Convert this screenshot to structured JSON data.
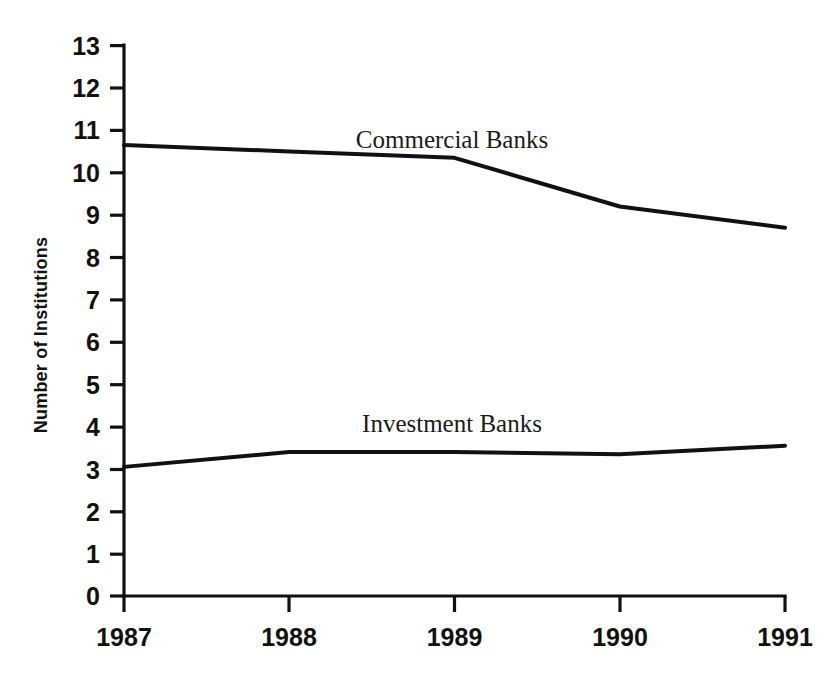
{
  "chart_data": {
    "type": "line",
    "title": "",
    "subtitle": "",
    "xlabel": "",
    "ylabel": "Number of Institutions",
    "x": [
      "1987",
      "1988",
      "1989",
      "1990",
      "1991"
    ],
    "categories": [
      "1987",
      "1988",
      "1989",
      "1990",
      "1991"
    ],
    "series": [
      {
        "name": "Commercial Banks",
        "values": [
          10.65,
          10.5,
          10.35,
          9.2,
          8.7
        ]
      },
      {
        "name": "Investment Banks",
        "values": [
          3.05,
          3.4,
          3.4,
          3.35,
          3.55
        ]
      }
    ],
    "xlim": [
      1987,
      1991
    ],
    "ylim": [
      0,
      13
    ],
    "ytick_labels": [
      "0",
      "1",
      "2",
      "3",
      "4",
      "5",
      "6",
      "7",
      "8",
      "9",
      "10",
      "11",
      "12",
      "13"
    ],
    "ytick_values": [
      0,
      1,
      2,
      3,
      4,
      5,
      6,
      7,
      8,
      9,
      10,
      11,
      12,
      13
    ],
    "xtick_labels": [
      "1987",
      "1988",
      "1989",
      "1990",
      "1991"
    ],
    "grid": false,
    "legend": "inline-annotations",
    "annotations": [
      {
        "text": "Commercial Banks",
        "near_x": "1989",
        "near_y": 11.0
      },
      {
        "text": "Investment Banks",
        "near_x": "1989",
        "near_y": 4.0
      }
    ],
    "colors": {
      "line": "#111111",
      "axis": "#111111",
      "background": "#ffffff",
      "text": "#111111"
    }
  },
  "labels": {
    "y_axis_title": "Number of Institutions",
    "series_commercial": "Commercial Banks",
    "series_investment": "Investment Banks"
  }
}
